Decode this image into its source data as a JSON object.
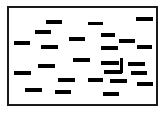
{
  "figure": {
    "canvas": {
      "width": 166,
      "height": 113,
      "background": "#ffffff"
    },
    "frame": {
      "name": "plot-frame",
      "x": 7,
      "y": 6,
      "width": 151,
      "height": 100,
      "border_width": 2,
      "border_color": "#1a1a1a",
      "fill": "#ffffff"
    },
    "mark_color": "#000000",
    "counts": {
      "horizontal_dashes": 24,
      "vertical_dashes": 1,
      "total_marks": 25
    },
    "marks": [
      {
        "id": 1,
        "orientation": "horizontal",
        "x": 46,
        "y": 20,
        "width": 16,
        "height": 4
      },
      {
        "id": 2,
        "orientation": "horizontal",
        "x": 88,
        "y": 22,
        "width": 15,
        "height": 3
      },
      {
        "id": 3,
        "orientation": "horizontal",
        "x": 136,
        "y": 17,
        "width": 17,
        "height": 4
      },
      {
        "id": 4,
        "orientation": "horizontal",
        "x": 35,
        "y": 30,
        "width": 16,
        "height": 4
      },
      {
        "id": 5,
        "orientation": "horizontal",
        "x": 101,
        "y": 33,
        "width": 14,
        "height": 4
      },
      {
        "id": 6,
        "orientation": "horizontal",
        "x": 69,
        "y": 37,
        "width": 16,
        "height": 4
      },
      {
        "id": 7,
        "orientation": "horizontal",
        "x": 119,
        "y": 39,
        "width": 16,
        "height": 4
      },
      {
        "id": 8,
        "orientation": "horizontal",
        "x": 14,
        "y": 41,
        "width": 16,
        "height": 4
      },
      {
        "id": 9,
        "orientation": "horizontal",
        "x": 41,
        "y": 45,
        "width": 17,
        "height": 4
      },
      {
        "id": 10,
        "orientation": "horizontal",
        "x": 101,
        "y": 46,
        "width": 17,
        "height": 4
      },
      {
        "id": 11,
        "orientation": "horizontal",
        "x": 137,
        "y": 45,
        "width": 15,
        "height": 4
      },
      {
        "id": 12,
        "orientation": "horizontal",
        "x": 73,
        "y": 58,
        "width": 17,
        "height": 4
      },
      {
        "id": 13,
        "orientation": "horizontal",
        "x": 101,
        "y": 61,
        "width": 18,
        "height": 4
      },
      {
        "id": 14,
        "orientation": "horizontal",
        "x": 128,
        "y": 62,
        "width": 17,
        "height": 4
      },
      {
        "id": 15,
        "orientation": "horizontal",
        "x": 38,
        "y": 64,
        "width": 17,
        "height": 4
      },
      {
        "id": 16,
        "orientation": "vertical",
        "x": 120,
        "y": 58,
        "width": 3,
        "height": 15
      },
      {
        "id": 17,
        "orientation": "horizontal",
        "x": 14,
        "y": 71,
        "width": 17,
        "height": 4
      },
      {
        "id": 18,
        "orientation": "horizontal",
        "x": 104,
        "y": 70,
        "width": 18,
        "height": 4
      },
      {
        "id": 19,
        "orientation": "horizontal",
        "x": 131,
        "y": 71,
        "width": 16,
        "height": 4
      },
      {
        "id": 20,
        "orientation": "horizontal",
        "x": 58,
        "y": 78,
        "width": 17,
        "height": 4
      },
      {
        "id": 21,
        "orientation": "horizontal",
        "x": 88,
        "y": 78,
        "width": 15,
        "height": 4
      },
      {
        "id": 22,
        "orientation": "horizontal",
        "x": 110,
        "y": 79,
        "width": 17,
        "height": 4
      },
      {
        "id": 23,
        "orientation": "horizontal",
        "x": 137,
        "y": 82,
        "width": 16,
        "height": 4
      },
      {
        "id": 24,
        "orientation": "horizontal",
        "x": 25,
        "y": 88,
        "width": 17,
        "height": 4
      },
      {
        "id": 25,
        "orientation": "horizontal",
        "x": 55,
        "y": 90,
        "width": 16,
        "height": 4
      },
      {
        "id": 26,
        "orientation": "horizontal",
        "x": 103,
        "y": 92,
        "width": 16,
        "height": 4
      }
    ]
  }
}
